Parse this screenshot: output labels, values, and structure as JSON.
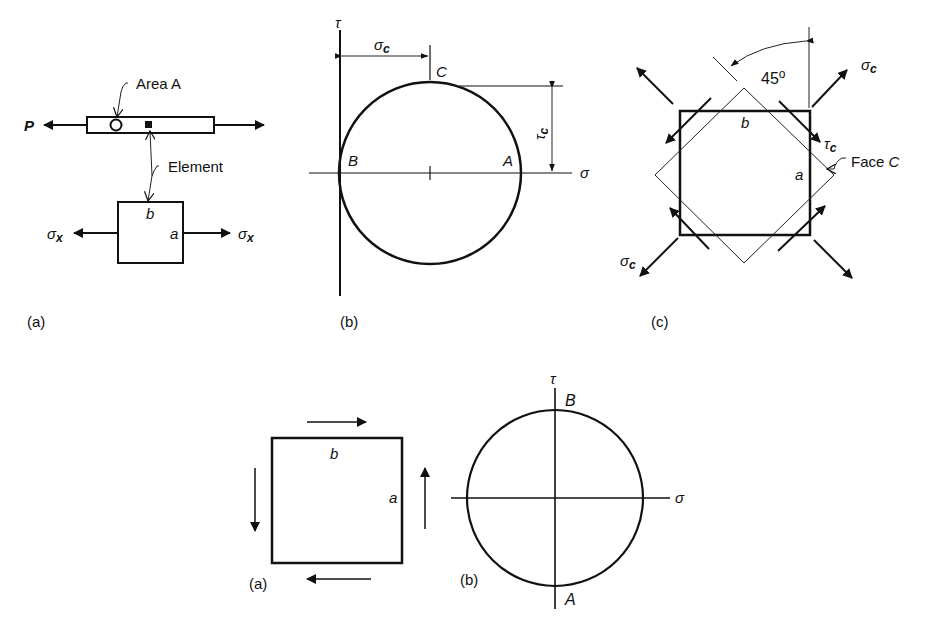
{
  "figure_top": {
    "panel_a": {
      "caption": "(a)",
      "load_label": "P",
      "area_label": "Area A",
      "element_label": "Element",
      "face_b": "b",
      "face_a": "a",
      "stress_left": "σ",
      "stress_left_sub": "x",
      "stress_right": "σ",
      "stress_right_sub": "x"
    },
    "panel_b": {
      "caption": "(b)",
      "tau_axis": "τ",
      "sigma_axis": "σ",
      "sigma_c": "σ",
      "sigma_c_sub": "c",
      "tau_c": "τ",
      "tau_c_sub": "c",
      "point_a": "A",
      "point_b": "B",
      "point_c": "C"
    },
    "panel_c": {
      "caption": "(c)",
      "angle": "45",
      "angle_unit": "o",
      "sigma_c_top": "σ",
      "sigma_c_top_sub": "c",
      "sigma_c_bottom": "σ",
      "sigma_c_bottom_sub": "c",
      "tau_c": "τ",
      "tau_c_sub": "c",
      "face_b": "b",
      "face_a": "a",
      "face_c_label": "Face",
      "face_c_letter": "C"
    }
  },
  "figure_bottom": {
    "panel_a": {
      "caption": "(a)",
      "face_b": "b",
      "face_a": "a"
    },
    "panel_b": {
      "caption": "(b)",
      "tau_axis": "τ",
      "sigma_axis": "σ",
      "point_a": "A",
      "point_b": "B"
    }
  }
}
